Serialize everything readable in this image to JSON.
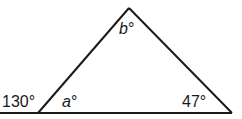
{
  "diagram": {
    "type": "triangle-exterior-angle",
    "stroke_color": "#1a1a1a",
    "labels": {
      "apex_angle": "b°",
      "apex_var": "b",
      "exterior_angle": "130°",
      "left_interior_var": "a",
      "left_interior": "a°",
      "right_interior": "47°"
    }
  }
}
